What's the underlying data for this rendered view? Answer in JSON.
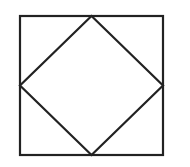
{
  "diagram": {
    "stroke_color": "#222222",
    "background": "#ffffff",
    "stroke_width": 2.2,
    "square": {
      "x": 20,
      "y": 16,
      "width": 143,
      "height": 139
    },
    "diamond": {
      "points": [
        [
          91.5,
          16
        ],
        [
          163,
          85.5
        ],
        [
          91.5,
          155
        ],
        [
          20,
          85.5
        ]
      ]
    }
  }
}
